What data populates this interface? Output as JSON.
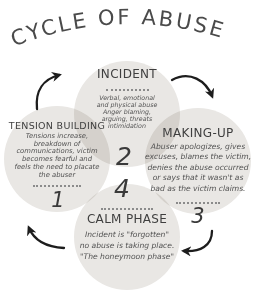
{
  "title": "CYCLE OF ABUSE",
  "colors": {
    "background": "#ffffff",
    "circle_fill": "#e9e7e4",
    "title_text": "#4a4a4a",
    "heading_text": "#3f3f3f",
    "body_text": "#525252",
    "number_text": "#3a3a3a",
    "divider_dots": "#8b8b8b",
    "arrow": "#1d1d1d"
  },
  "phases": [
    {
      "id": "tension-building",
      "number": "1",
      "title": "TENSION BUILDING",
      "body": "Tensions increase,\nbreakdown of\ncommunications, victim\nbecomes fearful and\nfeels the need to placate\nthe abuser"
    },
    {
      "id": "incident",
      "number": "2",
      "title": "INCIDENT",
      "body": "Verbal, emotional\nand physical abuse\nAnger blaming,\narguing, threats\nintimidation"
    },
    {
      "id": "making-up",
      "number": "3",
      "title": "MAKING-UP",
      "body": "Abuser apologizes, gives\nexcuses, blames the victim,\ndenies the abuse occurred\nor says that it wasn't as\nbad as the victim claims."
    },
    {
      "id": "calm-phase",
      "number": "4",
      "title": "CALM PHASE",
      "body": "Incident is \"forgotten\"\nno abuse is taking place.\n\"The honeymoon phase\""
    }
  ],
  "cycle_order": [
    "tension-building",
    "incident",
    "making-up",
    "calm-phase"
  ]
}
